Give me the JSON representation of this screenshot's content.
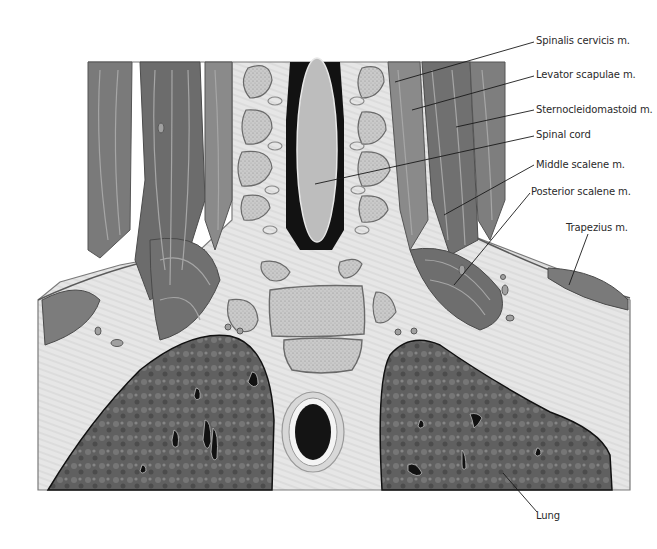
{
  "figure": {
    "colors": {
      "background": "#ffffff",
      "soft_tissue": "#e4e4e4",
      "muscle_dark": "#6e6e6e",
      "muscle_light": "#a8a8a8",
      "bone_fill": "#c9c9c9",
      "bone_outline": "#6a6a6a",
      "spinal_canal": "#121212",
      "spinal_cord": "#bdbdbd",
      "lung": "#5c5c5c",
      "label_text": "#2a2a2a",
      "leader_line": "#1a1a1a"
    }
  },
  "labels": [
    {
      "id": "spinalis-cervicis",
      "text": "Spinalis cervicis m.",
      "x": 536,
      "y": 62,
      "target": [
        395,
        82
      ]
    },
    {
      "id": "levator-scapulae",
      "text": "Levator scapulae m.",
      "x": 536,
      "y": 96,
      "target": [
        412,
        110
      ]
    },
    {
      "id": "sternocleidomastoid",
      "text": "Sternocleidomastoid m.",
      "x": 536,
      "y": 131,
      "target": [
        456,
        127
      ]
    },
    {
      "id": "spinal-cord",
      "text": "Spinal cord",
      "x": 536,
      "y": 164,
      "target": [
        315,
        184
      ]
    },
    {
      "id": "middle-scalene",
      "text": "Middle scalene m.",
      "x": 536,
      "y": 193,
      "target": [
        444,
        215
      ]
    },
    {
      "id": "posterior-scalene",
      "text": "Posterior scalene m.",
      "x": 532,
      "y": 219,
      "target": [
        454,
        285
      ]
    },
    {
      "id": "trapezius",
      "text": "Trapezius m.",
      "x": 566,
      "y": 260,
      "target": [
        569,
        285
      ]
    },
    {
      "id": "lung",
      "text": "Lung",
      "x": 537,
      "y": 536,
      "target": [
        503,
        473
      ]
    }
  ]
}
